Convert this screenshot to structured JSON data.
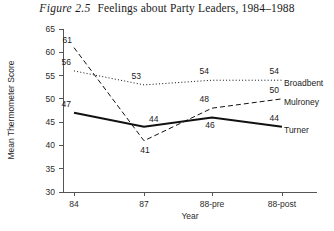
{
  "figure": {
    "number": "Figure 2.5",
    "caption": "Feelings about Party Leaders, 1984–1988"
  },
  "chart_data": {
    "type": "line",
    "xlabel": "Year",
    "ylabel": "Mean Thermometer Score",
    "categories": [
      "84",
      "87",
      "88-pre",
      "88-post"
    ],
    "ylim": [
      30,
      65
    ],
    "ytick_step": 5,
    "yticks": [
      "30",
      "35",
      "40",
      "45",
      "50",
      "55",
      "60",
      "65"
    ],
    "grid": false,
    "legend_position": "right-inline",
    "series": [
      {
        "name": "Broadbent",
        "style": "dotted",
        "values": [
          56,
          53,
          54,
          54
        ],
        "labels": [
          "56",
          "53",
          "54",
          "54"
        ]
      },
      {
        "name": "Mulroney",
        "style": "dashed",
        "values": [
          61,
          41,
          48,
          50
        ],
        "labels": [
          "61",
          "41",
          "48",
          "50"
        ]
      },
      {
        "name": "Turner",
        "style": "solid",
        "values": [
          47,
          44,
          46,
          44
        ],
        "labels": [
          "47",
          "44",
          "46",
          "44"
        ]
      }
    ]
  },
  "colors": {
    "ink": "#111111",
    "axis": "#555555",
    "background": "#ffffff"
  }
}
